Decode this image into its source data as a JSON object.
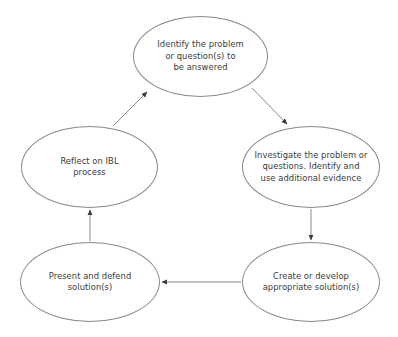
{
  "diagram": {
    "type": "cyclic-flowchart",
    "background_color": "#ffffff",
    "node_stroke_color": "#8a8a8a",
    "edge_color": "#8a8a8a",
    "text_color": "#3a3a3a",
    "nodes": [
      {
        "id": "identify",
        "label": "Identify the problem\nor question(s) to\nbe answered",
        "cx": 200,
        "cy": 56
      },
      {
        "id": "investigate",
        "label": "Investigate the problem or\nquestions. Identify and\nuse additional evidence",
        "cx": 311,
        "cy": 167
      },
      {
        "id": "create",
        "label": "Create or develop\nappropriate solution(s)",
        "cx": 311,
        "cy": 282
      },
      {
        "id": "present",
        "label": "Present and defend\nsolution(s)",
        "cx": 90,
        "cy": 282
      },
      {
        "id": "reflect",
        "label": "Reflect on IBL\nprocess",
        "cx": 89,
        "cy": 167
      }
    ],
    "edges": [
      {
        "from": "identify",
        "to": "investigate",
        "style": "diagonal-down-right"
      },
      {
        "from": "investigate",
        "to": "create",
        "style": "vertical-down"
      },
      {
        "from": "create",
        "to": "present",
        "style": "horizontal-left"
      },
      {
        "from": "present",
        "to": "reflect",
        "style": "vertical-up"
      },
      {
        "from": "reflect",
        "to": "identify",
        "style": "diagonal-up-right"
      }
    ]
  }
}
